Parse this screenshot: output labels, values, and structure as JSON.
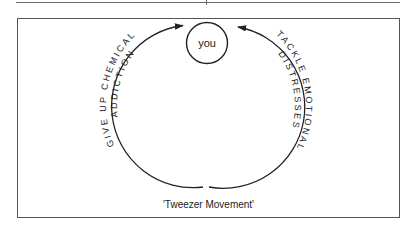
{
  "diagram": {
    "center_node": {
      "label": "you"
    },
    "left_path": {
      "outer_label": "GIVE UP CHEMICAL",
      "inner_label": "ADDICTION",
      "direction": "clockwise-upward-toward-you"
    },
    "right_path": {
      "outer_label": "TACKLE EMOTIONAL",
      "inner_label": "DISTRESSES",
      "direction": "counterclockwise-upward-toward-you"
    },
    "caption": "'Tweezer Movement'",
    "colors": {
      "stroke": "#222222",
      "frame": "#555555",
      "background": "#ffffff"
    }
  }
}
